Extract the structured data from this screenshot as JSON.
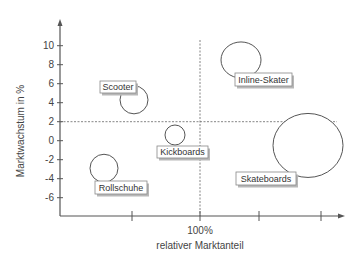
{
  "chart_data": {
    "type": "scatter",
    "subtype": "bubble",
    "title": "",
    "xlabel": "relativer Marktanteil",
    "ylabel": "Marktwachstum in %",
    "x_ticks": [
      {
        "label": "",
        "px": 132
      },
      {
        "label": "100%",
        "px": 200
      },
      {
        "label": "",
        "px": 259
      },
      {
        "label": "",
        "px": 321
      }
    ],
    "y_ticks": [
      10,
      8,
      6,
      4,
      2,
      0,
      -2,
      -4,
      -6
    ],
    "ylim": [
      -8,
      12
    ],
    "reference_lines": {
      "horizontal_y": 2,
      "vertical_x_label": "100%"
    },
    "grid": false,
    "legend": "none",
    "series": [
      {
        "name": "Scooter",
        "x_px": 134,
        "y": 4.3,
        "size_rx": 14,
        "size_ry": 14,
        "label_box": {
          "x": 100,
          "y": 81,
          "w": 36,
          "h": 12
        }
      },
      {
        "name": "Inline-Skater",
        "x_px": 241,
        "y": 8.5,
        "size_rx": 20,
        "size_ry": 18,
        "label_box": {
          "x": 235,
          "y": 73,
          "w": 57,
          "h": 13
        }
      },
      {
        "name": "Kickboards",
        "x_px": 175,
        "y": 0.6,
        "size_rx": 10,
        "size_ry": 10,
        "label_box": {
          "x": 157,
          "y": 146,
          "w": 51,
          "h": 12
        }
      },
      {
        "name": "Rollschuhe",
        "x_px": 104,
        "y": -2.9,
        "size_rx": 14,
        "size_ry": 14,
        "label_box": {
          "x": 95,
          "y": 181,
          "w": 52,
          "h": 13
        }
      },
      {
        "name": "Skateboards",
        "x_px": 308,
        "y": -0.5,
        "size_rx": 35,
        "size_ry": 32,
        "label_box": {
          "x": 236,
          "y": 172,
          "w": 60,
          "h": 13
        }
      }
    ]
  },
  "colors": {
    "axis": "#555555",
    "bubble_stroke": "#555555",
    "label_shadow": "#b8b8b8"
  }
}
